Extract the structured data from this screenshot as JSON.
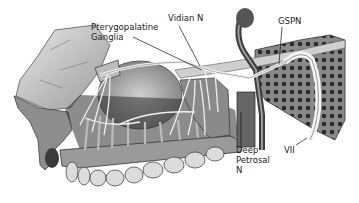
{
  "figure": {
    "labels": {
      "pterygopalatine": [
        "Pterygopalatine",
        "Ganglia"
      ],
      "vidian": "Vidian N",
      "gspn": "GSPN",
      "deep_petrosal": [
        "Deep",
        "Petrosal",
        "N"
      ],
      "vii": "VII"
    }
  }
}
